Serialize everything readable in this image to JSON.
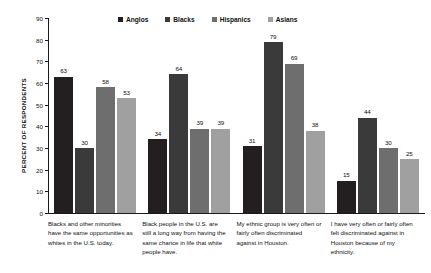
{
  "chart_data": {
    "type": "bar",
    "title": "",
    "xlabel": "",
    "ylabel": "PERCENT OF RESPONDENTS",
    "ylim": [
      0,
      90
    ],
    "ytick_values": [
      90,
      80,
      70,
      60,
      50,
      40,
      30,
      20,
      10,
      0
    ],
    "grid": false,
    "legend_position": "top-center",
    "categories": [
      "Blacks and other minorities have the same opportunities as whites in the U.S. today.",
      "Black people in the U.S. are still a long way from having the same chance in life that white people have.",
      "My ethnic group is very often or fairly often discriminated against in Houston.",
      "I have very often or fairly often felt discriminated against in Houston because of my ethnicity."
    ],
    "series": [
      {
        "name": "Anglos",
        "color": "#231f20",
        "values": [
          63,
          34,
          31,
          15
        ]
      },
      {
        "name": "Blacks",
        "color": "#3a3a3a",
        "values": [
          30,
          64,
          79,
          44
        ]
      },
      {
        "name": "Hispanics",
        "color": "#6e6e6e",
        "values": [
          58,
          39,
          69,
          30
        ]
      },
      {
        "name": "Asians",
        "color": "#a0a0a0",
        "values": [
          53,
          39,
          38,
          25
        ]
      }
    ]
  }
}
